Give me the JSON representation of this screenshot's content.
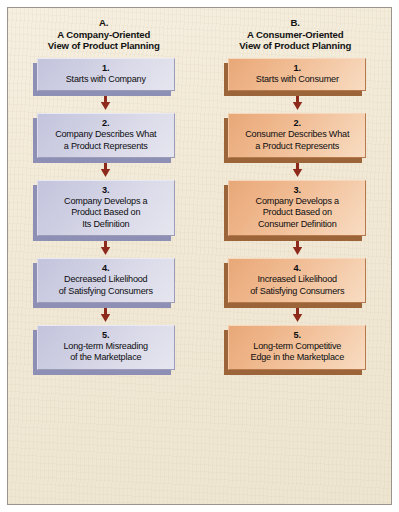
{
  "figure": {
    "background_color": "#f1e9d6",
    "border_color": "#9a958c",
    "arrow_color": "#8e2a1c",
    "arrow_icon": "down-arrow-icon"
  },
  "columns": [
    {
      "id": "a",
      "letter": "A.",
      "title": "A Company-Oriented\nView of Product Planning",
      "box_fill": "#cdcde2",
      "box_shadow": "#8e8fb4",
      "steps": [
        {
          "num": "1.",
          "label": "Starts with Company"
        },
        {
          "num": "2.",
          "label": "Company Describes What\na Product Represents"
        },
        {
          "num": "3.",
          "label": "Company Develops a\nProduct Based on\nIts Definition"
        },
        {
          "num": "4.",
          "label": "Decreased  Likelihood\nof Satisfying Consumers"
        },
        {
          "num": "5.",
          "label": "Long-term Misreading\nof the Marketplace"
        }
      ]
    },
    {
      "id": "b",
      "letter": "B.",
      "title": "A Consumer-Oriented\nView of Product Planning",
      "box_fill": "#eeb488",
      "box_shadow": "#9b6539",
      "steps": [
        {
          "num": "1.",
          "label": "Starts with Consumer"
        },
        {
          "num": "2.",
          "label": "Consumer Describes What\na Product Represents"
        },
        {
          "num": "3.",
          "label": "Company Develops a\nProduct Based on\nConsumer Definition"
        },
        {
          "num": "4.",
          "label": "Increased Likelihood\nof Satisfying Consumers"
        },
        {
          "num": "5.",
          "label": "Long-term Competitive\nEdge in the Marketplace"
        }
      ]
    }
  ]
}
